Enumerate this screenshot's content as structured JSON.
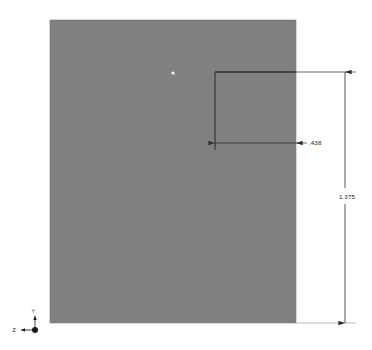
{
  "view": {
    "background_color": "#ffffff",
    "part_fill_color": "#808080",
    "line_color": "#2b2b2b",
    "text_color": "#1a1a1a",
    "vertex_color": "#f2f2f2"
  },
  "part": {
    "name": "sheet-metal-face",
    "x": 50,
    "y": 20,
    "width": 246,
    "height": 303
  },
  "notch": {
    "name": "rectangular-notch",
    "left": 215,
    "top": 72,
    "right": 296,
    "bottom": 150
  },
  "vertex_marker": {
    "x": 173,
    "y": 73,
    "r": 1.6
  },
  "dimensions": [
    {
      "id": "width-dimension",
      "label": ".438",
      "orientation": "horizontal",
      "line_y": 143,
      "start_x": 215,
      "end_x": 296,
      "text_x": 309,
      "text_y": 145,
      "leader_start_x": 296,
      "leader_end_x": 307
    },
    {
      "id": "height-dimension",
      "label": "1.375",
      "orientation": "vertical",
      "line_x": 345,
      "start_y": 72,
      "end_y": 323,
      "text_x": 339,
      "text_y": 198,
      "ext_top_y": 72,
      "ext_bottom_y": 323,
      "ext_left_x": 215,
      "ext_right_x": 356
    }
  ],
  "triad": {
    "name": "coordinate-triad",
    "origin_x": 35,
    "origin_y": 330,
    "axes": [
      {
        "label": "Y",
        "direction": "up",
        "label_x": 33,
        "label_y": 312,
        "tip_x": 35,
        "tip_y": 316
      },
      {
        "label": "Z",
        "direction": "left",
        "label_x": 14,
        "label_y": 332,
        "tip_x": 21,
        "tip_y": 330
      }
    ]
  }
}
